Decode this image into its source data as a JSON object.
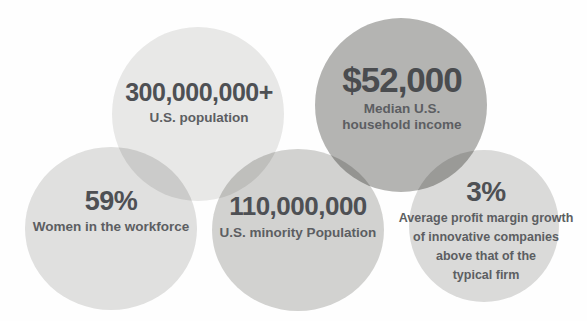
{
  "chart_data": {
    "type": "pie",
    "title": "",
    "layout": "overlapping venn-style bubbles",
    "legend": "none",
    "bubbles": [
      {
        "id": "population",
        "value": "300,000,000+",
        "caption": "U.S. population",
        "color": "#e8e8e7",
        "numeric": 300000000
      },
      {
        "id": "income",
        "value": "$52,000",
        "caption": "Median U.S.\nhousehold income",
        "caption_line1": "Median U.S.",
        "caption_line2": "household income",
        "color": "#b4b4b2",
        "numeric": 52000
      },
      {
        "id": "women",
        "value": "59%",
        "caption": "Women in the workforce",
        "color": "#e0e0df",
        "numeric": 59
      },
      {
        "id": "minority",
        "value": "110,000,000",
        "caption": "U.S. minority Population",
        "color": "#d2d2d0",
        "numeric": 110000000
      },
      {
        "id": "profit",
        "value": "3%",
        "caption": "Average profit margin growth of innovative companies above that of the typical firm",
        "caption_line1": "Average profit margin growth",
        "caption_line2": "of innovative companies",
        "caption_line3": "above that of the",
        "caption_line4": "typical firm",
        "color": "#dadad9",
        "numeric": 3
      }
    ]
  },
  "bubbles": {
    "population": {
      "value": "300,000,000+",
      "caption": "U.S. population"
    },
    "income": {
      "value": "$52,000",
      "caption_line1": "Median U.S.",
      "caption_line2": "household income"
    },
    "women": {
      "value": "59%",
      "caption": "Women in the workforce"
    },
    "minority": {
      "value": "110,000,000",
      "caption": "U.S. minority Population"
    },
    "profit": {
      "value": "3%",
      "caption_line1": "Average profit margin growth",
      "caption_line2": "of innovative companies",
      "caption_line3": "above that of the",
      "caption_line4": "typical firm"
    }
  }
}
